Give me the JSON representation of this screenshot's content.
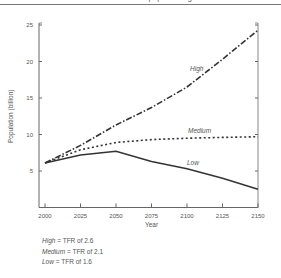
{
  "header": {
    "fragment": "... population growth ..."
  },
  "chart_data": {
    "type": "line",
    "title": "",
    "xlabel": "Year",
    "ylabel": "Population (billion)",
    "x": [
      2000,
      2025,
      2050,
      2075,
      2100,
      2125,
      2150
    ],
    "xticks": [
      "2000",
      "2025",
      "2050",
      "2075",
      "2100",
      "2125",
      "2150"
    ],
    "yticks": [
      "5",
      "10",
      "15",
      "20",
      "25"
    ],
    "ylim": [
      0,
      25
    ],
    "xlim": [
      2000,
      2150
    ],
    "grid": false,
    "series": [
      {
        "name": "High",
        "style": "dash-dot",
        "values": [
          6.1,
          8.5,
          11.3,
          13.7,
          16.5,
          20.3,
          24.3
        ]
      },
      {
        "name": "Medium",
        "style": "dotted",
        "values": [
          6.1,
          7.9,
          8.9,
          9.3,
          9.5,
          9.6,
          9.7
        ]
      },
      {
        "name": "Low",
        "style": "solid",
        "values": [
          6.1,
          7.2,
          7.7,
          6.3,
          5.3,
          4.0,
          2.5
        ]
      }
    ],
    "annotations": [
      "High",
      "Medium",
      "Low"
    ]
  },
  "legend": {
    "rows": [
      {
        "name": "High",
        "text": " = TFR of 2.6"
      },
      {
        "name": "Medium",
        "text": " = TFR of 2.1"
      },
      {
        "name": "Low",
        "text": " = TFR of 1.6"
      }
    ]
  }
}
